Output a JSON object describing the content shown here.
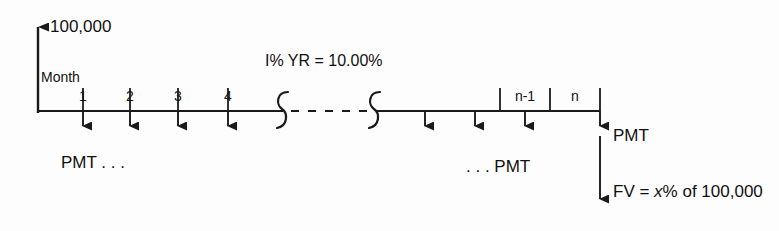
{
  "diagram": {
    "background_color": "#fdfdfd",
    "line_color": "#1a1a1a",
    "amount_label": "100,000",
    "axis_label": "Month",
    "rate_label": "I% YR = 10.00%",
    "pmt_left_label": "PMT . . .",
    "pmt_right_label": ". . . PMT",
    "pmt_final_label": "PMT",
    "fv_label_prefix": "FV = ",
    "fv_label_variable": "x",
    "fv_label_suffix": "% of 100,000",
    "fv_label_full": "FV = x% of 100,000",
    "periods": [
      {
        "label": "1",
        "x": 83
      },
      {
        "label": "2",
        "x": 130
      },
      {
        "label": "3",
        "x": 178
      },
      {
        "label": "4",
        "x": 228
      },
      {
        "label": "n-1",
        "x": 525
      },
      {
        "label": "n",
        "x": 575
      }
    ],
    "payment_arrows": [
      {
        "x": 83
      },
      {
        "x": 130
      },
      {
        "x": 178
      },
      {
        "x": 228
      },
      {
        "x": 425
      },
      {
        "x": 475
      },
      {
        "x": 525
      },
      {
        "x": 575
      }
    ],
    "axis": {
      "y": 111,
      "x_start": 38,
      "x_end": 600,
      "vertical_arrow_top": 16,
      "arrow_tip_y": 136,
      "fv_arrow_tip_y": 209
    },
    "break_symbols": [
      {
        "x": 283
      },
      {
        "x": 375
      }
    ],
    "dash_segment": {
      "x_start": 292,
      "x_end": 368
    }
  }
}
